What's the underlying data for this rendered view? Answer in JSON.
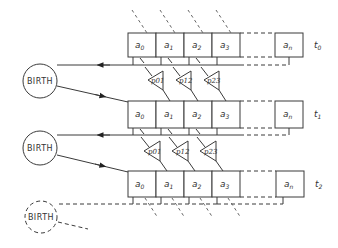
{
  "diagram": {
    "type": "population-genetics-generations",
    "rows": [
      {
        "time_label": "t",
        "time_sub": "0",
        "cells": [
          {
            "base": "a",
            "sub": "0"
          },
          {
            "base": "a",
            "sub": "1"
          },
          {
            "base": "a",
            "sub": "2"
          },
          {
            "base": "a",
            "sub": "3"
          },
          {
            "base": "a",
            "sub": "n"
          }
        ]
      },
      {
        "time_label": "t",
        "time_sub": "1",
        "cells": [
          {
            "base": "a",
            "sub": "0"
          },
          {
            "base": "a",
            "sub": "1"
          },
          {
            "base": "a",
            "sub": "2"
          },
          {
            "base": "a",
            "sub": "3"
          },
          {
            "base": "a",
            "sub": "n"
          }
        ]
      },
      {
        "time_label": "t",
        "time_sub": "2",
        "cells": [
          {
            "base": "a",
            "sub": "0"
          },
          {
            "base": "a",
            "sub": "1"
          },
          {
            "base": "a",
            "sub": "2"
          },
          {
            "base": "a",
            "sub": "3"
          },
          {
            "base": "a",
            "sub": "n"
          }
        ]
      }
    ],
    "transitions": [
      {
        "labels": [
          "p01",
          "p12",
          "p23"
        ]
      },
      {
        "labels": [
          "p01",
          "p12",
          "p23"
        ]
      }
    ],
    "birth_nodes": [
      {
        "label": "BIRTH",
        "style": "solid"
      },
      {
        "label": "BIRTH",
        "style": "solid"
      },
      {
        "label": "BIRTH",
        "style": "dashed"
      }
    ]
  }
}
